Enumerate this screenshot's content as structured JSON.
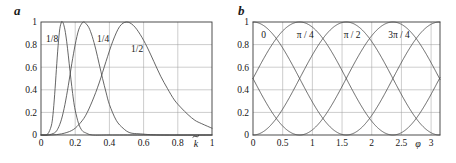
{
  "figure": {
    "background": "#ffffff",
    "curve_color": "#4a4a4a",
    "grid_color": "#9a9a9a",
    "frame_color": "#3a3a3a",
    "text_color": "#161616"
  },
  "panels": [
    {
      "id": "a",
      "letter": "a",
      "chart_data": {
        "type": "line",
        "title": "",
        "xlabel": "k̃",
        "ylabel": "",
        "xlim": [
          0,
          1
        ],
        "ylim": [
          0,
          1
        ],
        "grid": true,
        "legend": "inline-curve-labels",
        "xticks": [
          "0",
          "0.2",
          "0.4",
          "0.6",
          "0.8",
          "1"
        ],
        "xtick_values": [
          0,
          0.2,
          0.4,
          0.6,
          0.8,
          1
        ],
        "yticks": [
          "0",
          "0.2",
          "0.4",
          "0.6",
          "0.8",
          "1"
        ],
        "ytick_values": [
          0,
          0.2,
          0.4,
          0.6,
          0.8,
          1
        ],
        "series": [
          {
            "name": "1/8",
            "label": "1/8",
            "peak_x": 0.125,
            "peak_y": 1,
            "width": 0.045,
            "x": [
              0.0,
              0.02,
              0.04,
              0.06,
              0.07,
              0.08,
              0.09,
              0.1,
              0.11,
              0.12,
              0.125,
              0.13,
              0.14,
              0.15,
              0.16,
              0.17,
              0.18,
              0.19,
              0.2,
              0.22,
              0.24,
              0.26,
              0.3,
              0.4,
              0.6,
              1.0
            ],
            "y": [
              0.0,
              0.0,
              0.01,
              0.08,
              0.18,
              0.36,
              0.58,
              0.79,
              0.94,
              1.0,
              1.0,
              0.99,
              0.93,
              0.83,
              0.7,
              0.56,
              0.43,
              0.31,
              0.22,
              0.1,
              0.04,
              0.02,
              0.0,
              0.0,
              0.0,
              0.0
            ]
          },
          {
            "name": "1/4",
            "label": "1/4",
            "peak_x": 0.25,
            "peak_y": 1,
            "width": 0.085,
            "x": [
              0.0,
              0.04,
              0.08,
              0.1,
              0.12,
              0.14,
              0.16,
              0.18,
              0.2,
              0.22,
              0.24,
              0.25,
              0.26,
              0.28,
              0.3,
              0.32,
              0.34,
              0.36,
              0.38,
              0.4,
              0.44,
              0.48,
              0.52,
              0.58,
              0.7,
              1.0
            ],
            "y": [
              0.0,
              0.0,
              0.02,
              0.06,
              0.14,
              0.27,
              0.44,
              0.63,
              0.8,
              0.93,
              0.99,
              1.0,
              0.99,
              0.95,
              0.87,
              0.76,
              0.63,
              0.5,
              0.38,
              0.27,
              0.13,
              0.06,
              0.02,
              0.01,
              0.0,
              0.0
            ]
          },
          {
            "name": "1/2",
            "label": "1/2",
            "peak_x": 0.5,
            "peak_y": 1,
            "width": 0.17,
            "x": [
              0.0,
              0.06,
              0.12,
              0.18,
              0.22,
              0.26,
              0.3,
              0.34,
              0.38,
              0.42,
              0.46,
              0.5,
              0.54,
              0.58,
              0.62,
              0.66,
              0.7,
              0.74,
              0.78,
              0.82,
              0.86,
              0.9,
              0.94,
              1.0
            ],
            "y": [
              0.0,
              0.0,
              0.01,
              0.04,
              0.09,
              0.17,
              0.3,
              0.46,
              0.65,
              0.83,
              0.96,
              1.0,
              0.97,
              0.89,
              0.78,
              0.65,
              0.52,
              0.41,
              0.31,
              0.24,
              0.18,
              0.13,
              0.1,
              0.06
            ]
          }
        ]
      }
    },
    {
      "id": "b",
      "letter": "b",
      "chart_data": {
        "type": "line",
        "title": "",
        "xlabel": "φ",
        "ylabel": "",
        "xlim": [
          0,
          3.15
        ],
        "ylim": [
          0,
          1
        ],
        "grid": true,
        "legend": "inline-curve-labels",
        "xticks": [
          "0",
          "0.5",
          "1",
          "1.5",
          "2",
          "2.5",
          "3"
        ],
        "xtick_values": [
          0,
          0.5,
          1,
          1.5,
          2,
          2.5,
          3
        ],
        "yticks": [
          "0",
          "0.2",
          "0.4",
          "0.6",
          "0.8",
          "1"
        ],
        "ytick_values": [
          0,
          0.2,
          0.4,
          0.6,
          0.8,
          1
        ],
        "description": "Four oscillating cos-squared curves of period pi with phase offsets 0, pi/4, pi/2 and 3pi/4",
        "period": 3.14159,
        "series": [
          {
            "name": "0",
            "label": "0",
            "phase": 0.0,
            "formula": "cos^2(phi)",
            "amplitude": 1,
            "offset": 0
          },
          {
            "name": "pi/4",
            "label": "π / 4",
            "phase": 0.7854,
            "formula": "cos^2(phi - pi/4)",
            "amplitude": 1,
            "offset": 0
          },
          {
            "name": "pi/2",
            "label": "π / 2",
            "phase": 1.5708,
            "formula": "cos^2(phi - pi/2)",
            "amplitude": 1,
            "offset": 0
          },
          {
            "name": "3pi/4",
            "label": "3π / 4",
            "phase": 2.3562,
            "formula": "cos^2(phi - 3pi/4)",
            "amplitude": 1,
            "offset": 0
          }
        ],
        "label_positions": [
          {
            "label": "0",
            "x": 0.18,
            "y": 0.86
          },
          {
            "label": "π / 4",
            "x": 0.88,
            "y": 0.86
          },
          {
            "label": "π / 2",
            "x": 1.67,
            "y": 0.86
          },
          {
            "label": "3π / 4",
            "x": 2.46,
            "y": 0.86
          }
        ]
      }
    }
  ]
}
